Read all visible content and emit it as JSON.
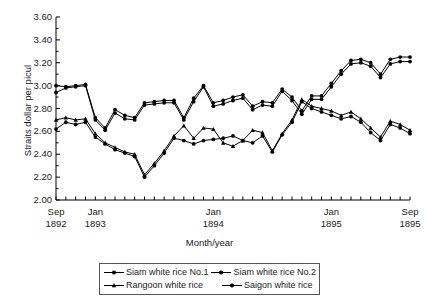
{
  "chart_data": {
    "type": "line",
    "title": "",
    "xlabel": "Month/year",
    "ylabel": "Straits dollar per picul",
    "ylim": [
      2.0,
      3.6
    ],
    "yticks": [
      "2.00",
      "2.20",
      "2.40",
      "2.60",
      "2.80",
      "3.00",
      "3.20",
      "3.40",
      "3.60"
    ],
    "ytick_values": [
      2.0,
      2.2,
      2.4,
      2.6,
      2.8,
      3.0,
      3.2,
      3.4,
      3.6
    ],
    "grid": false,
    "legend_position": "below",
    "x": [
      "Sep 1892",
      "Oct 1892",
      "Nov 1892",
      "Dec 1892",
      "Jan 1893",
      "Feb 1893",
      "Mar 1893",
      "Apr 1893",
      "May 1893",
      "Jun 1893",
      "Jul 1893",
      "Aug 1893",
      "Sep 1893",
      "Oct 1893",
      "Nov 1893",
      "Dec 1893",
      "Jan 1894",
      "Feb 1894",
      "Mar 1894",
      "Apr 1894",
      "May 1894",
      "Jun 1894",
      "Jul 1894",
      "Aug 1894",
      "Sep 1894",
      "Oct 1894",
      "Nov 1894",
      "Dec 1894",
      "Jan 1895",
      "Feb 1895",
      "Mar 1895",
      "Apr 1895",
      "May 1895",
      "Jun 1895",
      "Jul 1895",
      "Aug 1895",
      "Sep 1895"
    ],
    "xtick_labels": [
      {
        "line1": "Sep",
        "line2": "1892",
        "index": 0
      },
      {
        "line1": "Jan",
        "line2": "1893",
        "index": 4
      },
      {
        "line1": "Jan",
        "line2": "1894",
        "index": 16
      },
      {
        "line1": "Jan",
        "line2": "1895",
        "index": 28
      },
      {
        "line1": "Sep",
        "line2": "1895",
        "index": 36
      }
    ],
    "series": [
      {
        "name": "Siam white rice No.1",
        "marker": "circle",
        "color": "#000000",
        "values": [
          3.0,
          2.99,
          3.0,
          3.01,
          2.72,
          2.63,
          2.79,
          2.74,
          2.72,
          2.85,
          2.86,
          2.87,
          2.87,
          2.72,
          2.89,
          3.0,
          2.85,
          2.87,
          2.9,
          2.92,
          2.82,
          2.86,
          2.85,
          2.97,
          2.9,
          2.78,
          2.91,
          2.91,
          3.02,
          3.13,
          3.22,
          3.23,
          3.2,
          3.1,
          3.23,
          3.25,
          3.25
        ]
      },
      {
        "name": "Siam white rice No.2",
        "marker": "circle",
        "color": "#000000",
        "values": [
          2.94,
          2.98,
          2.99,
          3.0,
          2.7,
          2.61,
          2.76,
          2.71,
          2.7,
          2.83,
          2.84,
          2.85,
          2.85,
          2.7,
          2.86,
          2.99,
          2.82,
          2.84,
          2.87,
          2.89,
          2.79,
          2.83,
          2.82,
          2.95,
          2.87,
          2.75,
          2.88,
          2.88,
          2.99,
          3.1,
          3.19,
          3.2,
          3.17,
          3.07,
          3.19,
          3.21,
          3.21
        ]
      },
      {
        "name": "Rangoon white rice",
        "marker": "triangle",
        "color": "#000000",
        "values": [
          2.7,
          2.72,
          2.7,
          2.71,
          2.58,
          2.5,
          2.46,
          2.42,
          2.4,
          2.22,
          2.32,
          2.43,
          2.56,
          2.65,
          2.54,
          2.63,
          2.62,
          2.5,
          2.47,
          2.52,
          2.61,
          2.59,
          2.43,
          2.58,
          2.7,
          2.88,
          2.82,
          2.8,
          2.78,
          2.74,
          2.77,
          2.71,
          2.63,
          2.55,
          2.69,
          2.66,
          2.61
        ]
      },
      {
        "name": "Saigon white rice",
        "marker": "circle",
        "color": "#000000",
        "values": [
          2.62,
          2.68,
          2.66,
          2.68,
          2.55,
          2.49,
          2.44,
          2.41,
          2.38,
          2.2,
          2.3,
          2.41,
          2.54,
          2.52,
          2.49,
          2.52,
          2.53,
          2.54,
          2.56,
          2.52,
          2.5,
          2.56,
          2.42,
          2.57,
          2.68,
          2.86,
          2.8,
          2.77,
          2.74,
          2.71,
          2.73,
          2.68,
          2.59,
          2.52,
          2.66,
          2.63,
          2.58
        ]
      }
    ]
  },
  "legend": {
    "entries": [
      {
        "label": "Siam white rice No.1"
      },
      {
        "label": "Siam white rice No.2"
      },
      {
        "label": "Rangoon white rice"
      },
      {
        "label": "Saigon white rice"
      }
    ]
  }
}
